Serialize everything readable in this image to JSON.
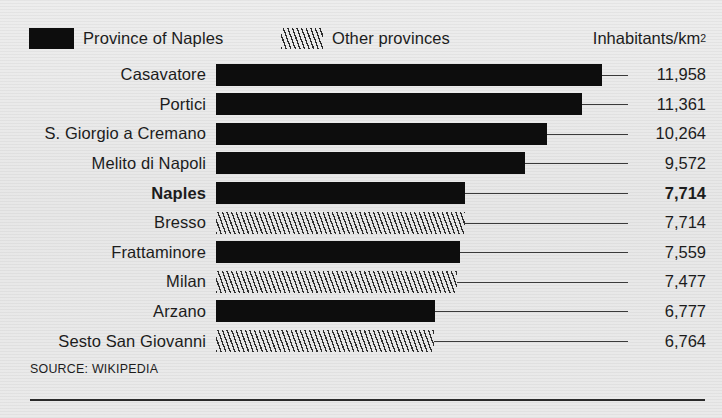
{
  "legend": {
    "items": [
      {
        "label": "Province of Naples",
        "swatch": "solid-black-swatch",
        "color": "#0d0d0d"
      },
      {
        "label": "Other provinces",
        "swatch": "diagonal-hatch-swatch",
        "color": "#2b2b2b"
      }
    ],
    "units_text": "Inhabitants/km",
    "units_superscript": "2"
  },
  "footer": {
    "source": "SOURCE: WIKIPEDIA"
  },
  "chart_data": {
    "type": "bar",
    "orientation": "horizontal",
    "title": "",
    "subtitle": "",
    "xlabel": "Inhabitants/km2",
    "ylabel": "",
    "grid": false,
    "legend_position": "top-left",
    "xlim": [
      0,
      12400
    ],
    "categories": [
      "Casavatore",
      "Portici",
      "S. Giorgio a Cremano",
      "Melito di Napoli",
      "Naples",
      "Bresso",
      "Frattaminore",
      "Milan",
      "Arzano",
      "Sesto San Giovanni"
    ],
    "values": [
      11958,
      11361,
      10264,
      9572,
      7714,
      7714,
      7559,
      7477,
      6777,
      6764
    ],
    "value_labels": [
      "11,958",
      "11,361",
      "10,264",
      "9,572",
      "7,714",
      "7,714",
      "7,559",
      "7,477",
      "6,777",
      "6,764"
    ],
    "groups": [
      "Province of Naples",
      "Province of Naples",
      "Province of Naples",
      "Province of Naples",
      "Province of Naples",
      "Other provinces",
      "Province of Naples",
      "Other provinces",
      "Province of Naples",
      "Other provinces"
    ],
    "highlighted": [
      "Naples"
    ],
    "source": "SOURCE: WIKIPEDIA"
  }
}
